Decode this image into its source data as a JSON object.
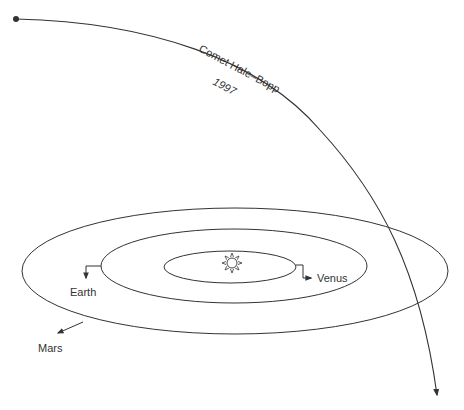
{
  "diagram": {
    "comet": {
      "name": "Comet Hale–Bopp",
      "year": "1997"
    },
    "planets": [
      {
        "name": "Venus"
      },
      {
        "name": "Earth"
      },
      {
        "name": "Mars"
      }
    ],
    "center": {
      "icon": "sun-icon"
    },
    "colors": {
      "line": "#333333",
      "background": "#ffffff"
    }
  }
}
